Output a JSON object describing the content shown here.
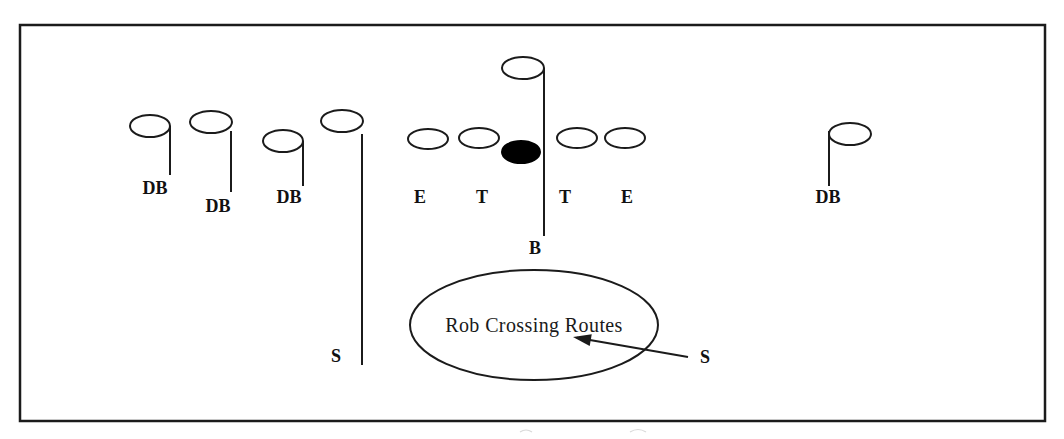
{
  "diagram": {
    "type": "football-play-diagram",
    "colors": {
      "ink": "#1b1b1b",
      "paper": "#ffffff",
      "ball_fill": "#000000"
    },
    "field_border": {
      "x": 20,
      "y": 25,
      "width": 1025,
      "height": 396
    },
    "callout": {
      "text": "Rob Crossing Routes",
      "ellipse": {
        "cx": 534,
        "cy": 325,
        "rx": 124,
        "ry": 55
      },
      "text_x": 534,
      "text_y": 332
    },
    "arrow": {
      "from_x": 688,
      "from_y": 357,
      "to_x": 573,
      "to_y": 337,
      "label": "S"
    },
    "players": [
      {
        "id": "db-left-1",
        "label": "DB",
        "role": "defensive-back",
        "filled": false,
        "cx": 150,
        "cy": 126,
        "rx": 20,
        "ry": 11,
        "label_x": 155,
        "label_y": 194,
        "line": {
          "x1": 170,
          "y1": 126,
          "x2": 170,
          "y2": 175
        }
      },
      {
        "id": "db-left-2",
        "label": "DB",
        "role": "defensive-back",
        "filled": false,
        "cx": 211,
        "cy": 122,
        "rx": 21,
        "ry": 11,
        "label_x": 218,
        "label_y": 212,
        "line": {
          "x1": 231,
          "y1": 131,
          "x2": 231,
          "y2": 192
        }
      },
      {
        "id": "db-left-3",
        "label": "DB",
        "role": "defensive-back",
        "filled": false,
        "cx": 283,
        "cy": 141,
        "rx": 20,
        "ry": 11,
        "label_x": 289,
        "label_y": 203,
        "line": {
          "x1": 303,
          "y1": 141,
          "x2": 303,
          "y2": 186
        }
      },
      {
        "id": "safety-left",
        "label": "S",
        "role": "safety",
        "filled": false,
        "cx": 342,
        "cy": 121,
        "rx": 21,
        "ry": 11,
        "label_x": 336,
        "label_y": 362,
        "line": {
          "x1": 362,
          "y1": 134,
          "x2": 362,
          "y2": 365
        }
      },
      {
        "id": "end-left",
        "label": "E",
        "role": "defensive-end",
        "filled": false,
        "cx": 428,
        "cy": 139,
        "rx": 20,
        "ry": 10,
        "label_x": 420,
        "label_y": 203,
        "line": null
      },
      {
        "id": "tackle-left",
        "label": "T",
        "role": "defensive-tackle",
        "filled": false,
        "cx": 479,
        "cy": 138,
        "rx": 20,
        "ry": 10,
        "label_x": 482,
        "label_y": 203,
        "line": null
      },
      {
        "id": "ball-center",
        "label": "",
        "role": "ball-center",
        "filled": true,
        "cx": 521,
        "cy": 152,
        "rx": 19,
        "ry": 11,
        "label_x": 0,
        "label_y": 0,
        "line": null
      },
      {
        "id": "tackle-right",
        "label": "T",
        "role": "defensive-tackle",
        "filled": false,
        "cx": 577,
        "cy": 138,
        "rx": 20,
        "ry": 10,
        "label_x": 565,
        "label_y": 203,
        "line": null
      },
      {
        "id": "end-right",
        "label": "E",
        "role": "defensive-end",
        "filled": false,
        "cx": 625,
        "cy": 138,
        "rx": 20,
        "ry": 10,
        "label_x": 627,
        "label_y": 203,
        "line": null
      },
      {
        "id": "backer-mike",
        "label": "B",
        "role": "linebacker",
        "filled": false,
        "cx": 523,
        "cy": 68,
        "rx": 21,
        "ry": 11,
        "label_x": 535,
        "label_y": 254,
        "line": {
          "x1": 544,
          "y1": 68,
          "x2": 544,
          "y2": 236
        }
      },
      {
        "id": "db-right-1",
        "label": "DB",
        "role": "defensive-back",
        "filled": false,
        "cx": 850,
        "cy": 134,
        "rx": 21,
        "ry": 11,
        "label_x": 828,
        "label_y": 203,
        "line": {
          "x1": 829,
          "y1": 131,
          "x2": 829,
          "y2": 186
        }
      }
    ]
  }
}
